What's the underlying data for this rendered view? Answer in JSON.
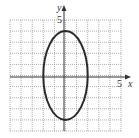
{
  "chart_data": {
    "type": "line",
    "title": "",
    "xlabel": "x",
    "ylabel": "y",
    "xlim": [
      -5,
      5
    ],
    "ylim": [
      -5,
      5
    ],
    "grid": true,
    "grid_step": 1,
    "tick_labels": {
      "x": [
        "5"
      ],
      "y": [
        "5"
      ]
    },
    "curve": {
      "kind": "ellipse",
      "equation": "x^2/4 + y^2/16 = 1",
      "center": [
        0,
        0
      ],
      "semi_axis_x": 2,
      "semi_axis_y": 4,
      "vertices": [
        [
          0,
          4
        ],
        [
          0,
          -4
        ]
      ],
      "co_vertices": [
        [
          -2,
          0
        ],
        [
          2,
          0
        ]
      ]
    }
  },
  "labels": {
    "x_axis": "x",
    "y_axis": "y",
    "x_tick": "5",
    "y_tick": "5"
  },
  "colors": {
    "grid": "#9a9a9a",
    "axis": "#333333",
    "curve": "#2a2a2a"
  }
}
